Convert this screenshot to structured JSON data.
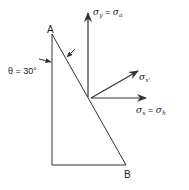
{
  "diagram": {
    "point_a_label": "A",
    "point_b_label": "B",
    "angle_label": "θ = 30°",
    "stress_y": {
      "symbol": "σ",
      "sub": "y",
      "eq": " = ",
      "rhs_symbol": "σ",
      "rhs_sub": "a"
    },
    "stress_x_prime": {
      "symbol": "σ",
      "sub": "x'"
    },
    "stress_x": {
      "symbol": "σ",
      "sub": "x",
      "eq": " = ",
      "rhs_symbol": "σ",
      "rhs_sub": "h"
    },
    "line_color": "#333333"
  }
}
